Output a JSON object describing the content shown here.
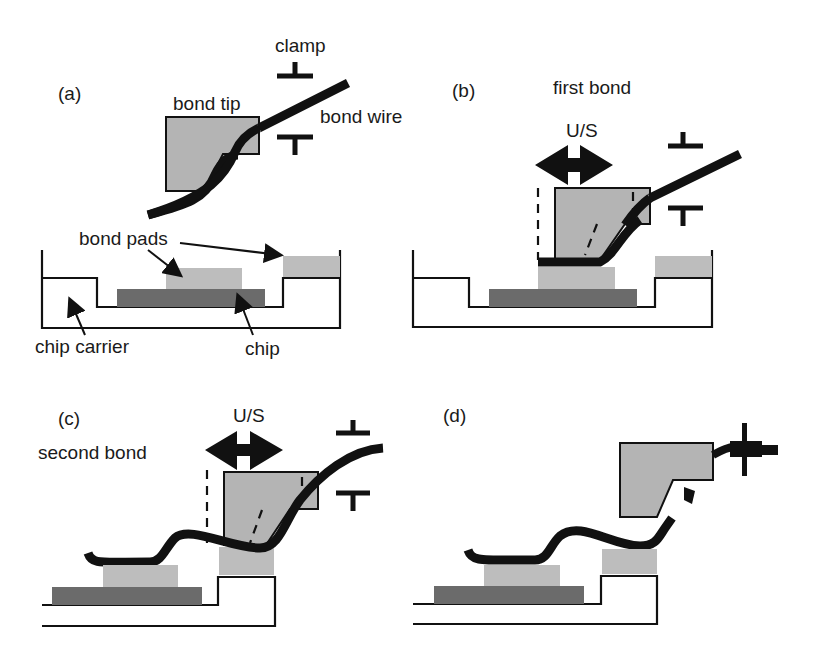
{
  "figure": {
    "colors": {
      "bond_tip": "#b4b4b4",
      "bond_pad": "#bdbdbd",
      "chip": "#6b6b6b",
      "wire": "#111111"
    },
    "panels": [
      {
        "id": "a",
        "label": "(a)",
        "annotations": {
          "clamp": "clamp",
          "bond_tip": "bond tip",
          "bond_wire": "bond wire",
          "bond_pads": "bond pads",
          "chip_carrier": "chip carrier",
          "chip": "chip"
        }
      },
      {
        "id": "b",
        "label": "(b)",
        "caption": "first bond",
        "motion": "U/S"
      },
      {
        "id": "c",
        "label": "(c)",
        "caption": "second bond",
        "motion": "U/S"
      },
      {
        "id": "d",
        "label": "(d)"
      }
    ]
  }
}
